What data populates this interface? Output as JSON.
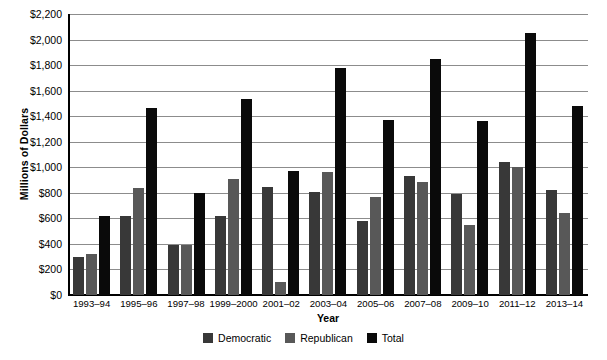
{
  "chart_data": {
    "type": "bar",
    "title": "",
    "xlabel": "Year",
    "ylabel": "Millions of Dollars",
    "ylim": [
      0,
      2200
    ],
    "ytick_step": 200,
    "grid": true,
    "legend_position": "bottom",
    "categories": [
      "1993–94",
      "1995–96",
      "1997–98",
      "1999–2000",
      "2001–02",
      "2003–04",
      "2005–06",
      "2007–08",
      "2009–10",
      "2011–12",
      "2013–14"
    ],
    "ytick_labels": [
      "$2,200",
      "$2,000",
      "$1,800",
      "$1,600",
      "$1,400",
      "$1,200",
      "$1,000",
      "$800",
      "$600",
      "$400",
      "$200",
      "$0"
    ],
    "ytick_values": [
      2200,
      2000,
      1800,
      1600,
      1400,
      1200,
      1000,
      800,
      600,
      400,
      200,
      0
    ],
    "series": [
      {
        "name": "Democratic",
        "color": "#383838",
        "values": [
          300,
          615,
          395,
          615,
          845,
          805,
          580,
          935,
          790,
          1040,
          825
        ]
      },
      {
        "name": "Republican",
        "color": "#585858",
        "values": [
          320,
          840,
          395,
          910,
          100,
          960,
          770,
          885,
          545,
          1000,
          640
        ]
      },
      {
        "name": "Total",
        "color": "#0a0a0a",
        "values": [
          620,
          1465,
          800,
          1535,
          970,
          1775,
          1370,
          1845,
          1365,
          2055,
          1480
        ]
      }
    ]
  },
  "legend": {
    "items": [
      {
        "label": "Democratic",
        "color": "#383838"
      },
      {
        "label": "Republican",
        "color": "#585858"
      },
      {
        "label": "Total",
        "color": "#0a0a0a"
      }
    ]
  }
}
